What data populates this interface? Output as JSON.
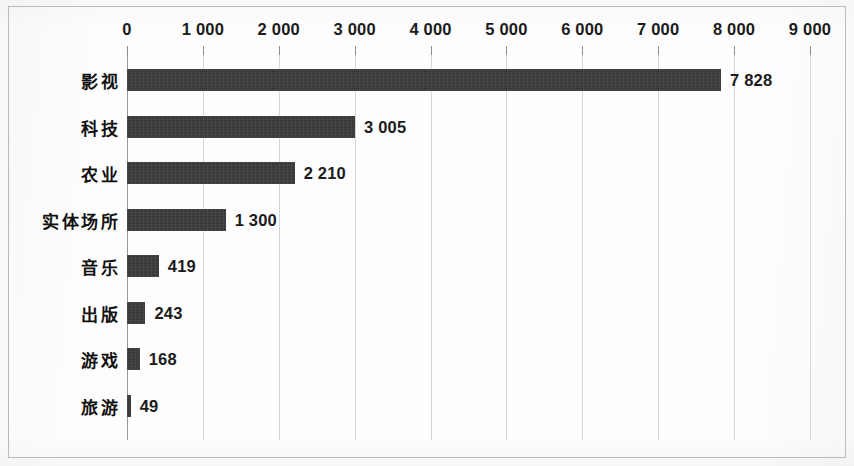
{
  "chart_data": {
    "type": "bar",
    "orientation": "horizontal",
    "title": "",
    "subtitle": "",
    "xlabel": "",
    "ylabel": "",
    "categories": [
      "影视",
      "科技",
      "农业",
      "实体场所",
      "音乐",
      "出版",
      "游戏",
      "旅游"
    ],
    "values": [
      7828,
      3005,
      2210,
      1300,
      419,
      243,
      168,
      49
    ],
    "value_labels": [
      "7 828",
      "3 005",
      "2 210",
      "1 300",
      "419",
      "243",
      "168",
      "49"
    ],
    "xlim": [
      0,
      9000
    ],
    "xticks": [
      0,
      1000,
      2000,
      3000,
      4000,
      5000,
      6000,
      7000,
      8000,
      9000
    ],
    "xtick_labels": [
      "0",
      "1 000",
      "2 000",
      "3 000",
      "4 000",
      "5 000",
      "6 000",
      "7 000",
      "8 000",
      "9 000"
    ],
    "grid": true,
    "grid_axis": "x",
    "legend": false,
    "legend_position": "none",
    "bar_color": "#3a3a3a",
    "grid_color": "#d6d6d6",
    "axis_color": "#9a9a9a",
    "label_color": "#1b1b1b",
    "background_color": "#fdfdfd",
    "frame_border_color": "#b9b9b9",
    "value_label_position": "outside-end",
    "thousands_separator": "space"
  }
}
